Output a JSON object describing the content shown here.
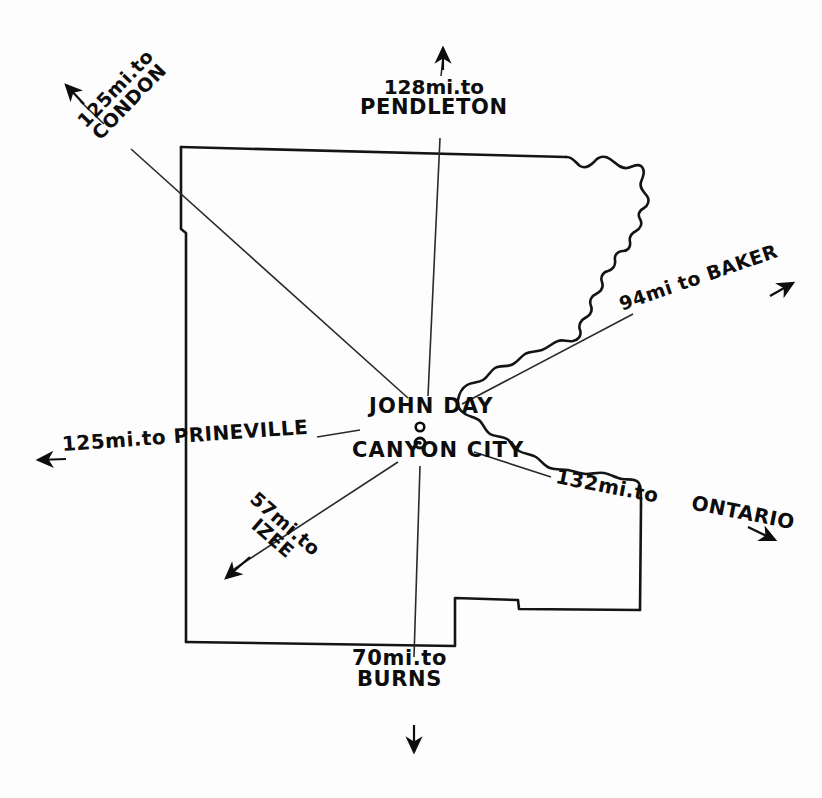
{
  "map": {
    "title": "Grant County road distance map",
    "hub": {
      "city_primary": "JOHN DAY",
      "city_secondary": "CANYON CITY"
    },
    "ink_color": "#0d0d0d",
    "paper_color": "#fdfdfd",
    "spokes": [
      {
        "id": "pendleton",
        "distance_line": "128mi.to",
        "destination": "PENDLETON",
        "direction": "north"
      },
      {
        "id": "condon",
        "distance_line": "125mi.to",
        "destination": "CONDON",
        "direction": "northwest"
      },
      {
        "id": "baker",
        "text": "94mi to BAKER",
        "destination": "BAKER",
        "direction": "northeast"
      },
      {
        "id": "prineville",
        "text": "125mi.to PRINEVILLE",
        "destination": "PRINEVILLE",
        "direction": "west"
      },
      {
        "id": "ontario",
        "distance_line": "132mi.to",
        "destination": "ONTARIO",
        "direction": "east"
      },
      {
        "id": "izee",
        "distance_line": "57mi.to",
        "destination": "IZEE",
        "direction": "southwest"
      },
      {
        "id": "burns",
        "distance_line": "70mi.to",
        "destination": "BURNS",
        "direction": "south"
      }
    ]
  }
}
